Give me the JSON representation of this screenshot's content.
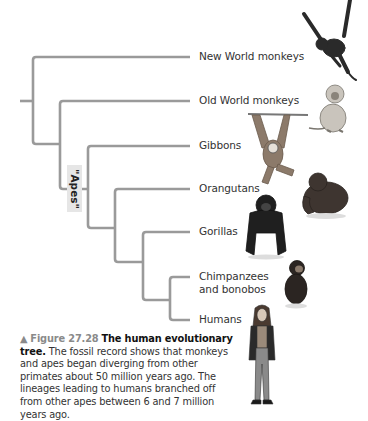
{
  "diagram": {
    "type": "phylogenetic-tree",
    "apes_label": "\"Apes\"",
    "line_color": "#9a9a9a",
    "taxa": [
      {
        "label": "New World monkeys",
        "y": 57
      },
      {
        "label": "Old World monkeys",
        "y": 101
      },
      {
        "label": "Gibbons",
        "y": 146
      },
      {
        "label": "Orangutans",
        "y": 189
      },
      {
        "label": "Gorillas",
        "y": 232
      },
      {
        "label_line1": "Chimpanzees",
        "label_line2": "and bonobos",
        "y": 277
      },
      {
        "label": "Humans",
        "y": 320
      }
    ]
  },
  "caption": {
    "marker": "▲",
    "figure": "Figure 27.28",
    "title": "The human evolutionary tree.",
    "text": "The fossil record shows that monkeys and apes began diverging from other primates about 50 million years ago. The lineages leading to humans branched off from other apes between 6 and 7 million years ago."
  }
}
